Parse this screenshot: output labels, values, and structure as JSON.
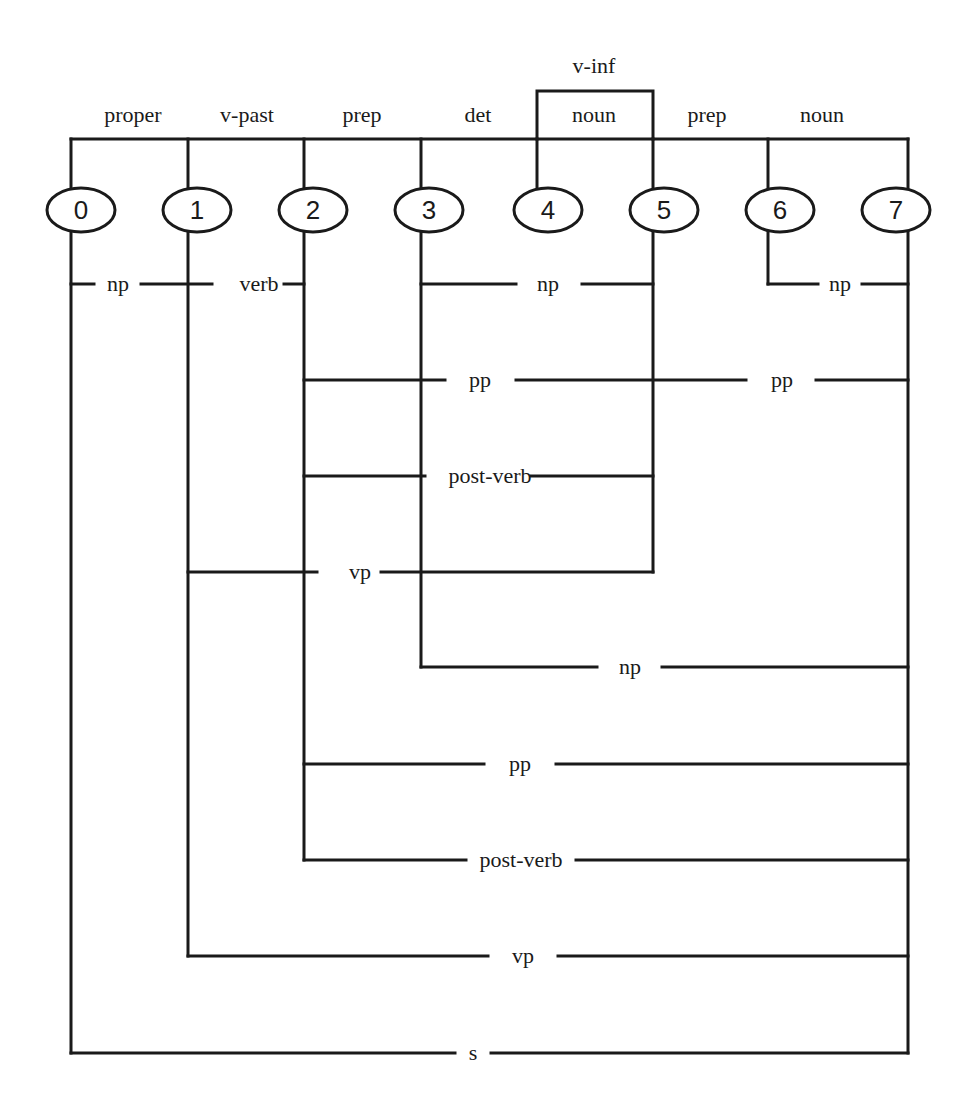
{
  "diagram": {
    "type": "chart-parse",
    "nodes": [
      "0",
      "1",
      "2",
      "3",
      "4",
      "5",
      "6",
      "7"
    ],
    "lexical_edges": [
      {
        "from": 0,
        "to": 1,
        "label": "proper"
      },
      {
        "from": 1,
        "to": 2,
        "label": "v-past"
      },
      {
        "from": 2,
        "to": 3,
        "label": "prep"
      },
      {
        "from": 3,
        "to": 4,
        "label": "det"
      },
      {
        "from": 4,
        "to": 5,
        "label": "noun"
      },
      {
        "from": 4,
        "to": 5,
        "label": "v-inf"
      },
      {
        "from": 5,
        "to": 6,
        "label": "prep"
      },
      {
        "from": 6,
        "to": 7,
        "label": "noun"
      }
    ],
    "phrase_edges": [
      {
        "from": 0,
        "to": 1,
        "label": "np"
      },
      {
        "from": 1,
        "to": 2,
        "label": "verb"
      },
      {
        "from": 3,
        "to": 5,
        "label": "np"
      },
      {
        "from": 6,
        "to": 7,
        "label": "np"
      },
      {
        "from": 2,
        "to": 5,
        "label": "pp"
      },
      {
        "from": 5,
        "to": 7,
        "label": "pp"
      },
      {
        "from": 2,
        "to": 5,
        "label": "post-verb"
      },
      {
        "from": 1,
        "to": 5,
        "label": "vp"
      },
      {
        "from": 3,
        "to": 7,
        "label": "np"
      },
      {
        "from": 2,
        "to": 7,
        "label": "pp"
      },
      {
        "from": 2,
        "to": 7,
        "label": "post-verb"
      },
      {
        "from": 1,
        "to": 7,
        "label": "vp"
      },
      {
        "from": 0,
        "to": 7,
        "label": "s"
      }
    ]
  },
  "labels": {
    "top": {
      "proper": "proper",
      "v_past": "v-past",
      "prep1": "prep",
      "det": "det",
      "noun1": "noun",
      "v_inf": "v-inf",
      "prep2": "prep",
      "noun2": "noun"
    },
    "bottom": {
      "np_0_1": "np",
      "verb_1_2": "verb",
      "np_3_5": "np",
      "np_6_7": "np",
      "pp_2_5": "pp",
      "pp_5_7": "pp",
      "postverb_2_5": "post-verb",
      "vp_1_5": "vp",
      "np_3_7": "np",
      "pp_2_7": "pp",
      "postverb_2_7": "post-verb",
      "vp_1_7": "vp",
      "s_0_7": "s"
    }
  }
}
